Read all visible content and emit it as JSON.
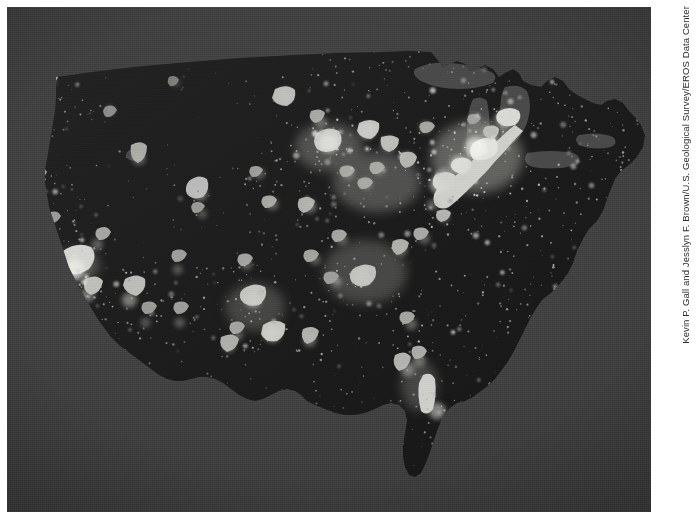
{
  "figure": {
    "kind": "satellite-nighttime-lights-map",
    "alt": "Satellite composite showing city lights of the contiguous United States at night",
    "credit": "Kevin P. Gall and Jesslyn F. Brown/U.S. Geological Survey/EROS Data Center",
    "colors": {
      "page_background": "#ffffff",
      "water_background": "#3e3e3e",
      "land_dark": "#1d1d1d",
      "lights_bright": "#d7d7d4",
      "lights_mid": "#9a9a96",
      "lights_dim": "#5d5d5a"
    }
  },
  "chart_data": {
    "type": "heatmap",
    "xlabel": "",
    "ylabel": "",
    "legend_position": "none",
    "grid": false,
    "value_units": "relative light intensity",
    "value_range": [
      0,
      100
    ],
    "regions": [
      {
        "name": "Northeast megalopolis",
        "intensity": 100
      },
      {
        "name": "Great Lakes / Chicago",
        "intensity": 92
      },
      {
        "name": "Southern California",
        "intensity": 90
      },
      {
        "name": "Florida coasts",
        "intensity": 85
      },
      {
        "name": "Texas Triangle",
        "intensity": 80
      },
      {
        "name": "Ohio Valley",
        "intensity": 78
      },
      {
        "name": "Southeast Piedmont",
        "intensity": 70
      },
      {
        "name": "Puget Sound",
        "intensity": 62
      },
      {
        "name": "Front Range",
        "intensity": 55
      },
      {
        "name": "Great Basin / Northern Plains",
        "intensity": 8
      }
    ],
    "city_lights": [
      {
        "label": "Seattle",
        "x": 0.088,
        "y": 0.085,
        "magnitude": 62
      },
      {
        "label": "Portland",
        "x": 0.065,
        "y": 0.145,
        "magnitude": 52
      },
      {
        "label": "Spokane",
        "x": 0.15,
        "y": 0.092,
        "magnitude": 30
      },
      {
        "label": "Boise",
        "x": 0.16,
        "y": 0.205,
        "magnitude": 28
      },
      {
        "label": "Sacramento",
        "x": 0.04,
        "y": 0.34,
        "magnitude": 45
      },
      {
        "label": "San Francisco",
        "x": 0.025,
        "y": 0.378,
        "magnitude": 66
      },
      {
        "label": "Fresno",
        "x": 0.063,
        "y": 0.43,
        "magnitude": 34
      },
      {
        "label": "Los Angeles",
        "x": 0.105,
        "y": 0.52,
        "magnitude": 95
      },
      {
        "label": "San Diego",
        "x": 0.125,
        "y": 0.57,
        "magnitude": 60
      },
      {
        "label": "Las Vegas",
        "x": 0.14,
        "y": 0.47,
        "magnitude": 42
      },
      {
        "label": "Salt Lake City",
        "x": 0.205,
        "y": 0.3,
        "magnitude": 48
      },
      {
        "label": "Phoenix",
        "x": 0.19,
        "y": 0.58,
        "magnitude": 62
      },
      {
        "label": "Tucson",
        "x": 0.215,
        "y": 0.625,
        "magnitude": 34
      },
      {
        "label": "Albuquerque",
        "x": 0.265,
        "y": 0.52,
        "magnitude": 34
      },
      {
        "label": "El Paso",
        "x": 0.268,
        "y": 0.625,
        "magnitude": 36
      },
      {
        "label": "Denver",
        "x": 0.3,
        "y": 0.37,
        "magnitude": 58
      },
      {
        "label": "Colorado Springs",
        "x": 0.303,
        "y": 0.41,
        "magnitude": 32
      },
      {
        "label": "Billings",
        "x": 0.262,
        "y": 0.15,
        "magnitude": 20
      },
      {
        "label": "Minneapolis",
        "x": 0.432,
        "y": 0.175,
        "magnitude": 60
      },
      {
        "label": "Omaha",
        "x": 0.392,
        "y": 0.33,
        "magnitude": 38
      },
      {
        "label": "Kansas City",
        "x": 0.412,
        "y": 0.39,
        "magnitude": 46
      },
      {
        "label": "Oklahoma City",
        "x": 0.372,
        "y": 0.51,
        "magnitude": 40
      },
      {
        "label": "Dallas",
        "x": 0.382,
        "y": 0.58,
        "magnitude": 70
      },
      {
        "label": "Austin",
        "x": 0.358,
        "y": 0.65,
        "magnitude": 40
      },
      {
        "label": "San Antonio",
        "x": 0.345,
        "y": 0.672,
        "magnitude": 45
      },
      {
        "label": "Houston",
        "x": 0.412,
        "y": 0.648,
        "magnitude": 72
      },
      {
        "label": "New Orleans",
        "x": 0.47,
        "y": 0.66,
        "magnitude": 50
      },
      {
        "label": "Memphis",
        "x": 0.478,
        "y": 0.5,
        "magnitude": 40
      },
      {
        "label": "St. Louis",
        "x": 0.47,
        "y": 0.395,
        "magnitude": 52
      },
      {
        "label": "Chicago",
        "x": 0.5,
        "y": 0.27,
        "magnitude": 88
      },
      {
        "label": "Milwaukee",
        "x": 0.487,
        "y": 0.228,
        "magnitude": 45
      },
      {
        "label": "Indianapolis",
        "x": 0.53,
        "y": 0.33,
        "magnitude": 46
      },
      {
        "label": "Detroit",
        "x": 0.56,
        "y": 0.245,
        "magnitude": 70
      },
      {
        "label": "Cleveland",
        "x": 0.592,
        "y": 0.272,
        "magnitude": 58
      },
      {
        "label": "Columbus",
        "x": 0.578,
        "y": 0.322,
        "magnitude": 44
      },
      {
        "label": "Cincinnati",
        "x": 0.558,
        "y": 0.35,
        "magnitude": 44
      },
      {
        "label": "Pittsburgh",
        "x": 0.622,
        "y": 0.3,
        "magnitude": 52
      },
      {
        "label": "Nashville",
        "x": 0.52,
        "y": 0.46,
        "magnitude": 42
      },
      {
        "label": "Atlanta",
        "x": 0.553,
        "y": 0.535,
        "magnitude": 66
      },
      {
        "label": "Birmingham",
        "x": 0.512,
        "y": 0.545,
        "magnitude": 38
      },
      {
        "label": "Charlotte",
        "x": 0.612,
        "y": 0.48,
        "magnitude": 48
      },
      {
        "label": "Raleigh",
        "x": 0.648,
        "y": 0.458,
        "magnitude": 42
      },
      {
        "label": "Norfolk",
        "x": 0.678,
        "y": 0.415,
        "magnitude": 44
      },
      {
        "label": "Richmond",
        "x": 0.66,
        "y": 0.392,
        "magnitude": 40
      },
      {
        "label": "Washington",
        "x": 0.67,
        "y": 0.352,
        "magnitude": 78
      },
      {
        "label": "Baltimore",
        "x": 0.678,
        "y": 0.336,
        "magnitude": 70
      },
      {
        "label": "Philadelphia",
        "x": 0.702,
        "y": 0.312,
        "magnitude": 84
      },
      {
        "label": "New York",
        "x": 0.728,
        "y": 0.278,
        "magnitude": 100
      },
      {
        "label": "Hartford",
        "x": 0.748,
        "y": 0.248,
        "magnitude": 52
      },
      {
        "label": "Boston",
        "x": 0.772,
        "y": 0.222,
        "magnitude": 78
      },
      {
        "label": "Albany",
        "x": 0.726,
        "y": 0.222,
        "magnitude": 40
      },
      {
        "label": "Buffalo",
        "x": 0.65,
        "y": 0.238,
        "magnitude": 44
      },
      {
        "label": "Tampa",
        "x": 0.622,
        "y": 0.718,
        "magnitude": 54
      },
      {
        "label": "Orlando",
        "x": 0.64,
        "y": 0.7,
        "magnitude": 48
      },
      {
        "label": "Jacksonville",
        "x": 0.628,
        "y": 0.628,
        "magnitude": 44
      },
      {
        "label": "Miami",
        "x": 0.668,
        "y": 0.8,
        "magnitude": 72
      }
    ],
    "water_bodies": [
      "Pacific Ocean",
      "Atlantic Ocean",
      "Gulf of Mexico",
      "Lake Superior",
      "Lake Michigan",
      "Lake Huron",
      "Lake Erie",
      "Lake Ontario",
      "Great Salt Lake"
    ]
  }
}
